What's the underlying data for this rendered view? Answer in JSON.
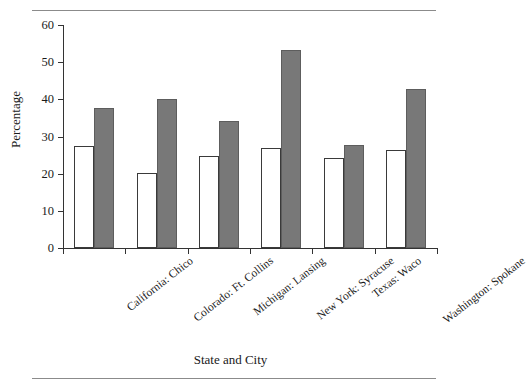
{
  "chart_data": {
    "type": "bar",
    "title": "",
    "xlabel": "State and City",
    "ylabel": "Percentage",
    "categories": [
      "California: Chico",
      "Colorado: Ft. Collins",
      "Michigan: Lansing",
      "New York: Syracuse",
      "Texas: Waco",
      "Washington: Spokane"
    ],
    "series": [
      {
        "name": "open-bar",
        "style": "white",
        "values": [
          27.5,
          20.3,
          24.7,
          26.8,
          24.3,
          26.5
        ]
      },
      {
        "name": "filled-bar",
        "style": "gray",
        "values": [
          37.8,
          40.0,
          34.2,
          53.3,
          27.8,
          42.8
        ]
      }
    ],
    "ylim": [
      0,
      60
    ],
    "yticks": [
      0,
      10,
      20,
      30,
      40,
      50,
      60
    ],
    "ytick_labels": [
      "0",
      "10",
      "20",
      "30",
      "40",
      "50",
      "60"
    ],
    "grid": false,
    "legend": "none",
    "colors": {
      "open": "#ffffff",
      "filled": "#787878",
      "axis": "#333333",
      "rule": "#8b8b8b"
    }
  },
  "figure": {
    "rule_top": "",
    "rule_bottom": ""
  }
}
